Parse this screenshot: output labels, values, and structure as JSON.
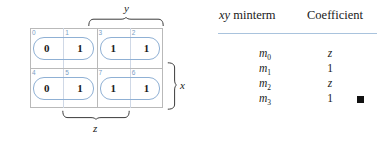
{
  "figure": {
    "kmap": {
      "name": "karnaugh-map",
      "rows": [
        {
          "cells": [
            {
              "index": "0",
              "value": "0"
            },
            {
              "index": "1",
              "value": "1"
            },
            {
              "index": "3",
              "value": "1"
            },
            {
              "index": "2",
              "value": "1"
            }
          ]
        },
        {
          "cells": [
            {
              "index": "4",
              "value": "0"
            },
            {
              "index": "5",
              "value": "1"
            },
            {
              "index": "7",
              "value": "1"
            },
            {
              "index": "6",
              "value": "1"
            }
          ]
        }
      ],
      "groups": [
        {
          "name": "group-top-left",
          "cells": "0,1"
        },
        {
          "name": "group-top-right",
          "cells": "3,2"
        },
        {
          "name": "group-bottom-left",
          "cells": "4,5"
        },
        {
          "name": "group-bottom-right",
          "cells": "7,6"
        }
      ],
      "variables": {
        "top": "y",
        "bottom": "z",
        "right": "x"
      },
      "colors": {
        "grid": "#b9b9b9",
        "index_text": "#7a9ec4",
        "group_outline": "#8fb0d4",
        "value_text": "#1a1a1a"
      }
    },
    "table": {
      "name": "minterm-coefficient-table",
      "headers": {
        "minterm_prefix": "xy",
        "minterm": " minterm",
        "coefficient": "Coefficient"
      },
      "rule_color": "#a9c3dd",
      "rows": [
        {
          "minterm": "m",
          "subscript": "0",
          "coefficient": "z",
          "coefficient_italic": true
        },
        {
          "minterm": "m",
          "subscript": "1",
          "coefficient": "1",
          "coefficient_italic": false
        },
        {
          "minterm": "m",
          "subscript": "2",
          "coefficient": "z",
          "coefficient_italic": true
        },
        {
          "minterm": "m",
          "subscript": "3",
          "coefficient": "1",
          "coefficient_italic": false
        }
      ],
      "end_marker": "qed-square"
    }
  }
}
